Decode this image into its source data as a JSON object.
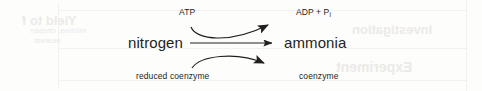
{
  "diagram": {
    "type": "biochemical-reaction-coupled-arrows",
    "substrate": {
      "label": "nitrogen",
      "x": 128,
      "y": 34
    },
    "product": {
      "label": "ammonia",
      "x": 284,
      "y": 34
    },
    "cosubstrates": [
      {
        "name": "atp",
        "label": "ATP",
        "x": 179,
        "y": 7,
        "role": "input-top"
      },
      {
        "name": "reduced-coenzyme",
        "label": "reduced coenzyme",
        "x": 136,
        "y": 71,
        "role": "input-bottom"
      }
    ],
    "coproducts": [
      {
        "name": "adp-phosphate",
        "label_prefix": "ADP + P",
        "label_subscript": "i",
        "x": 296,
        "y": 7,
        "role": "output-top"
      },
      {
        "name": "coenzyme",
        "label": "coenzyme",
        "x": 299,
        "y": 71,
        "role": "output-bottom"
      }
    ],
    "arrows": {
      "main": {
        "name": "main-reaction-arrow",
        "from_x": 190,
        "to_x": 277,
        "y": 43
      },
      "top_curve": {
        "name": "atp-consumption-curve",
        "description": "curves from below ATP up to ADP + Pi"
      },
      "bottom_curve": {
        "name": "coenzyme-oxidation-curve",
        "description": "curves from reduced coenzyme down to coenzyme"
      }
    },
    "colors": {
      "ink": "#231f20",
      "background": "#fdfdfc",
      "ghost": "#eceae8"
    }
  },
  "artifacts": {
    "bleed_through": [
      {
        "name": "ghost-yield-to",
        "text": "Yield to f",
        "x": 22,
        "y": 13,
        "size": 13
      },
      {
        "name": "ghost-investigation",
        "text": "Investigation",
        "x": 352,
        "y": 22,
        "size": 13
      },
      {
        "name": "ghost-experiment",
        "text": "Experiment",
        "x": 336,
        "y": 59,
        "size": 14
      },
      {
        "name": "ghost-line-a",
        "text": "minima, chosen",
        "x": 30,
        "y": 26,
        "size": 8
      },
      {
        "name": "ghost-line-b",
        "text": "nearest",
        "x": 34,
        "y": 36,
        "size": 8
      }
    ]
  }
}
